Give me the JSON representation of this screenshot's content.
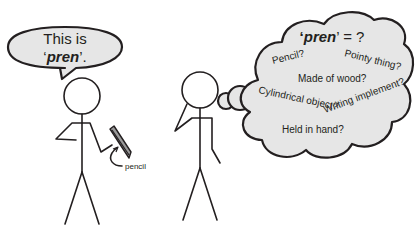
{
  "speech_bubble": {
    "line1": "This is",
    "line2_quote_open": "‘",
    "line2_word": "pren",
    "line2_quote_close": "’."
  },
  "pencil_label": "pencil",
  "thought_bubble": {
    "title_quote_open": "‘",
    "title_word": "pren",
    "title_rest": "’ = ?",
    "guesses": [
      "Pencil?",
      "Pointy thing?",
      "Made of wood?",
      "Cylindrical object?",
      "Writing implement?",
      "Held in hand?"
    ]
  },
  "colors": {
    "ink": "#231f20",
    "bubble_fill": "#e6e6e6",
    "background": "#ffffff"
  }
}
